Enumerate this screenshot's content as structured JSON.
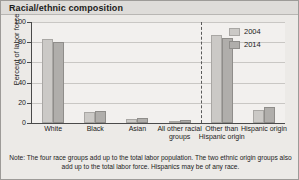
{
  "figure": {
    "title": "Racial/ethnic composition",
    "note": "Note: The four race groups add up to the total labor population. The two ethnic origin groups also add up to the total labor force. Hispanics may be of any race."
  },
  "legend": {
    "position": "top-right",
    "entries": [
      {
        "label": "2004",
        "color": "#cbc9c6"
      },
      {
        "label": "2014",
        "color": "#b0aeab"
      }
    ]
  },
  "axes": {
    "y_title": "Percent of labor force",
    "y_ticks": [
      "100",
      "80",
      "60",
      "40",
      "20",
      "0"
    ],
    "x_labels": [
      "White",
      "Black",
      "Asian",
      "All other racial groups",
      "Other than Hispanic origin",
      "Hispanic origin"
    ]
  },
  "chart_data": {
    "type": "bar",
    "title": "Racial/ethnic composition",
    "xlabel": "",
    "ylabel": "Percent of labor force",
    "ylim": [
      0,
      100
    ],
    "yticks": [
      0,
      20,
      40,
      60,
      80,
      100
    ],
    "grid": true,
    "legend_position": "top-right",
    "categories": [
      "White",
      "Black",
      "Asian",
      "All other racial groups",
      "Other than Hispanic origin",
      "Hispanic origin"
    ],
    "series": [
      {
        "name": "2004",
        "values": [
          83,
          11,
          4,
          2,
          87,
          13
        ]
      },
      {
        "name": "2014",
        "values": [
          80,
          12,
          5,
          3,
          84,
          16
        ]
      }
    ],
    "annotations": [
      "Dashed vertical divider separates the four race groups from the two ethnic origin groups"
    ],
    "note": "Note: The four race groups add up to the total labor population. The two ethnic origin groups also add up to the total labor force. Hispanics may be of any race."
  }
}
